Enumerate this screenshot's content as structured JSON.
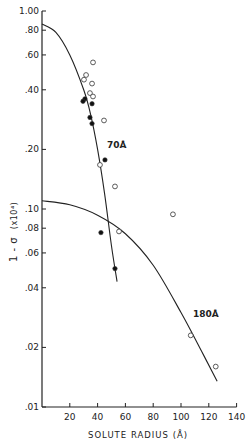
{
  "chart_data": {
    "type": "scatter",
    "title": "",
    "xlabel": "SOLUTE RADIUS (Å)",
    "ylabel": "1 - σ (x10⁴)",
    "xlim": [
      0,
      140
    ],
    "ylim": [
      0.01,
      1.0
    ],
    "yscale": "log",
    "x_ticks": [
      20,
      40,
      60,
      80,
      100,
      120,
      140
    ],
    "x_tick_labels": [
      "20",
      "40",
      "60",
      "80",
      "100",
      "120",
      "140"
    ],
    "y_ticks": [
      0.01,
      0.02,
      0.04,
      0.06,
      0.08,
      0.1,
      0.2,
      0.4,
      0.6,
      0.8,
      1.0
    ],
    "y_tick_labels": [
      ".01",
      ".02",
      ".04",
      ".06",
      ".08",
      ".10",
      ".20",
      ".40",
      ".60",
      ".80",
      "1.00"
    ],
    "grid": false,
    "series": [
      {
        "name": "open circles",
        "marker": "open-circle",
        "x": [
          36.7,
          31.7,
          30.2,
          36.0,
          34.5,
          36.7,
          44.6,
          41.7,
          52.5,
          55.4,
          94.2,
          107,
          125
        ],
        "y": [
          0.55,
          0.475,
          0.45,
          0.43,
          0.385,
          0.37,
          0.28,
          0.167,
          0.13,
          0.077,
          0.094,
          0.023,
          0.016
        ]
      },
      {
        "name": "filled circles",
        "marker": "filled-circle",
        "x": [
          30.9,
          29.5,
          36.0,
          34.5,
          36.0,
          45.3,
          42.4,
          52.5
        ],
        "y": [
          0.36,
          0.35,
          0.34,
          0.29,
          0.27,
          0.177,
          0.076,
          0.05
        ]
      }
    ],
    "curves": [
      {
        "name": "70 Å pore",
        "label": "70Å",
        "x": [
          0,
          10,
          20,
          30,
          35,
          40,
          45,
          50,
          54
        ],
        "y": [
          0.86,
          0.78,
          0.6,
          0.4,
          0.3,
          0.2,
          0.12,
          0.065,
          0.043
        ]
      },
      {
        "name": "180 Å pore",
        "label": "180Å",
        "x": [
          0,
          20,
          40,
          60,
          80,
          100,
          115,
          126
        ],
        "y": [
          0.11,
          0.105,
          0.093,
          0.075,
          0.052,
          0.03,
          0.019,
          0.0135
        ]
      }
    ],
    "annotations": [
      "70Å",
      "180Å"
    ],
    "legend": null
  },
  "labels": {
    "curve_70": "70Å",
    "curve_180": "180Å",
    "xlabel": "SOLUTE RADIUS (Å)",
    "ylabel_main": "1 - σ",
    "ylabel_unit": "(x10⁴)"
  }
}
